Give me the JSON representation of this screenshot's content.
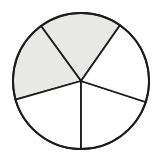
{
  "figure": {
    "title": "Circle divided into five sectors with two shaded",
    "shape": "circle",
    "center_x": 81,
    "center_y": 81,
    "radius": 68,
    "outline_color": "#1c1c1c",
    "background_color": "#ffffff",
    "shaded_color": "#e8e8e6",
    "unshaded_color": "#ffffff",
    "total_sectors": 5,
    "shaded_sectors": 2,
    "unshaded_sectors": 3,
    "fraction_shaded": "2/5"
  },
  "chart_data": {
    "type": "pie",
    "title": "Circle divided into five sectors with two shaded",
    "categories": [
      "top-sector",
      "upper-left-sector",
      "lower-left-sector",
      "lower-right-sector",
      "right-sector"
    ],
    "values": [
      71,
      70,
      74,
      72,
      73
    ],
    "legend_position": "none",
    "grid": false,
    "sectors": [
      {
        "name": "top-sector",
        "start_angle_deg": -126,
        "end_angle_deg": -55,
        "sweep_deg": 71,
        "shaded": true,
        "fill": "#e8e8e6"
      },
      {
        "name": "upper-left-sector",
        "start_angle_deg": -196,
        "end_angle_deg": -126,
        "sweep_deg": 70,
        "shaded": true,
        "fill": "#e8e8e6"
      },
      {
        "name": "lower-left-sector",
        "start_angle_deg": 164,
        "end_angle_deg": 90,
        "sweep_deg": 74,
        "shaded": false,
        "fill": "#ffffff"
      },
      {
        "name": "lower-right-sector",
        "start_angle_deg": 90,
        "end_angle_deg": 18,
        "sweep_deg": 72,
        "shaded": false,
        "fill": "#ffffff"
      },
      {
        "name": "right-sector",
        "start_angle_deg": 18,
        "end_angle_deg": -55,
        "sweep_deg": 73,
        "shaded": false,
        "fill": "#ffffff"
      }
    ]
  }
}
